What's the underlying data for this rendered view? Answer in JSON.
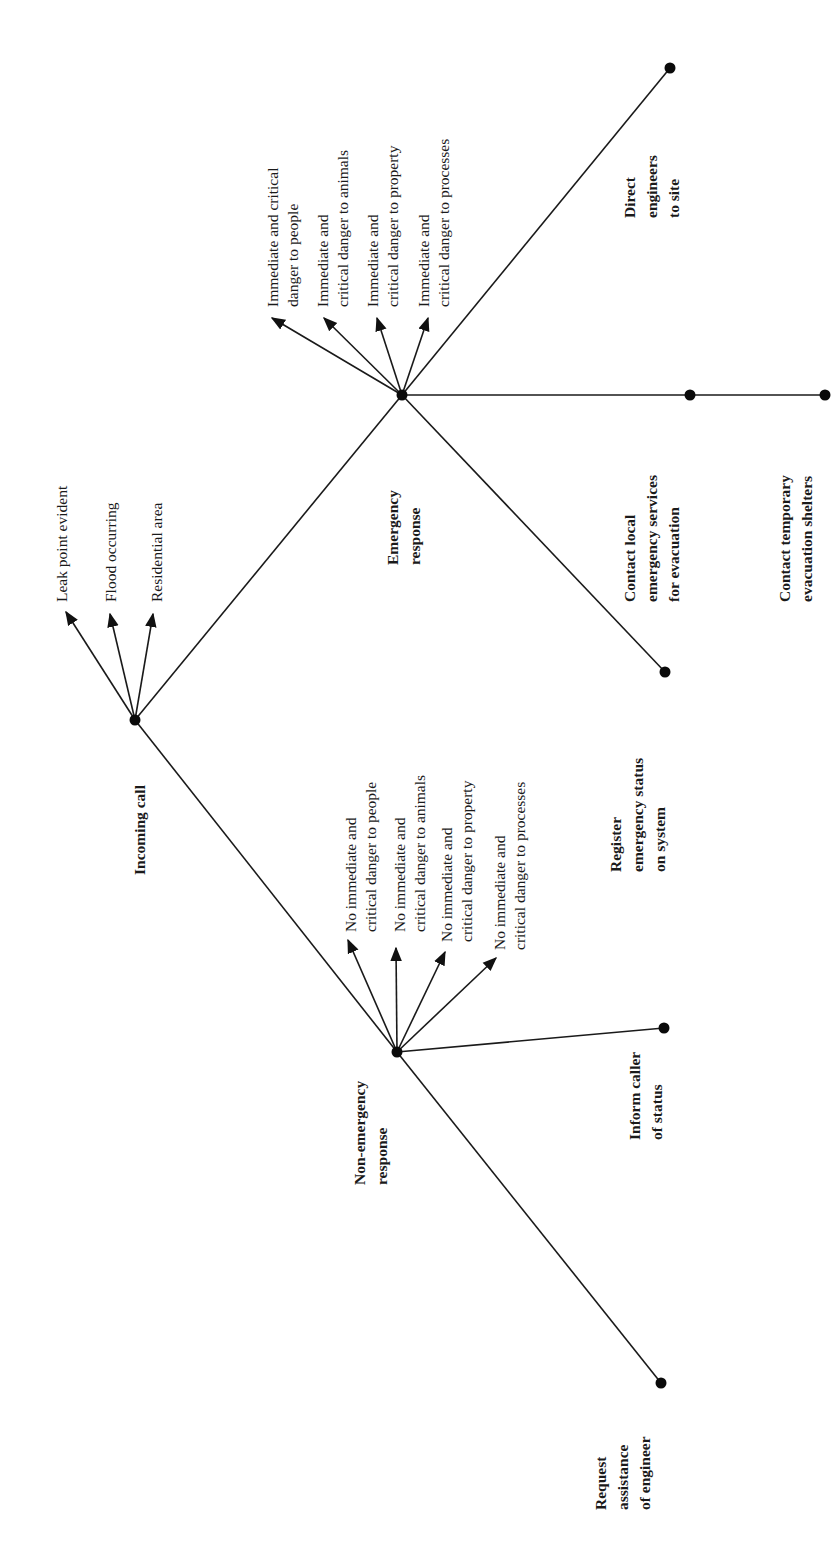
{
  "diagram": {
    "type": "tree",
    "orientation": "rotated-90-ccw",
    "root": {
      "label": "Incoming call",
      "conditions": [
        "Leak point evident",
        "Flood occurring",
        "Residential area"
      ],
      "children": [
        {
          "label_lines": [
            "Emergency",
            "response"
          ],
          "conditions": [
            [
              "Immediate and critical",
              "danger to people"
            ],
            [
              "Immediate and",
              "critical danger to animals"
            ],
            [
              "Immediate and",
              "critical danger to property"
            ],
            [
              "Immediate and",
              "critical danger to processes"
            ]
          ],
          "actions": [
            [
              "Direct",
              "engineers",
              "to site"
            ],
            [
              "Contact local",
              "emergency services",
              "for evacuation"
            ],
            [
              "Contact temporary",
              "evacuation shelters"
            ],
            [
              "Register",
              "emergency status",
              "on system"
            ]
          ]
        },
        {
          "label_lines": [
            "Non-emergency",
            "response"
          ],
          "conditions": [
            [
              "No immediate and",
              "critical danger to people"
            ],
            [
              "No immediate and",
              "critical danger to animals"
            ],
            [
              "No immediate and",
              "critical danger to property"
            ],
            [
              "No immediate and",
              "critical danger to processes"
            ]
          ],
          "actions": [
            [
              "Inform caller",
              "of status"
            ],
            [
              "Request",
              "assistance",
              "of engineer"
            ]
          ]
        }
      ]
    }
  },
  "labels": {
    "incoming": "Incoming call",
    "leak": "Leak point evident",
    "flood": "Flood occurring",
    "residential": "Residential area",
    "emerg1": "Emergency",
    "emerg2": "response",
    "e_c1a": "Immediate and critical",
    "e_c1b": "danger to people",
    "e_c2a": "Immediate and",
    "e_c2b": "critical danger to animals",
    "e_c3a": "Immediate and",
    "e_c3b": "critical danger to property",
    "e_c4a": "Immediate and",
    "e_c4b": "critical danger to processes",
    "direct1": "Direct",
    "direct2": "engineers",
    "direct3": "to site",
    "local1": "Contact local",
    "local2": "emergency services",
    "local3": "for evacuation",
    "temp1": "Contact temporary",
    "temp2": "evacuation shelters",
    "reg1": "Register",
    "reg2": "emergency status",
    "reg3": "on system",
    "non1": "Non-emergency",
    "non2": "response",
    "n_c1a": "No immediate and",
    "n_c1b": "critical danger to people",
    "n_c2a": "No immediate and",
    "n_c2b": "critical danger to animals",
    "n_c3a": "No immediate and",
    "n_c3b": "critical danger to property",
    "n_c4a": "No immediate and",
    "n_c4b": "critical danger to processes",
    "inform1": "Inform caller",
    "inform2": "of status",
    "req1": "Request",
    "req2": "assistance",
    "req3": "of engineer"
  }
}
